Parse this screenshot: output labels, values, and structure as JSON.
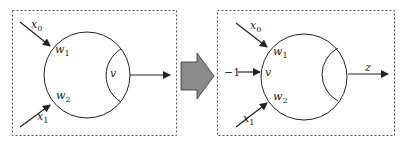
{
  "diagram": {
    "left_panel": {
      "inputs": [
        {
          "label": "x",
          "subscript": "0",
          "weight": "w",
          "weight_subscript": "1"
        },
        {
          "label": "x",
          "subscript": "1",
          "weight": "w",
          "weight_subscript": "2"
        }
      ],
      "threshold_label": "v",
      "output_label": ""
    },
    "transform_arrow": "right-arrow",
    "right_panel": {
      "inputs": [
        {
          "label": "x",
          "subscript": "0",
          "weight": "w",
          "weight_subscript": "1"
        },
        {
          "label": "−1",
          "subscript": "",
          "weight": "v",
          "weight_subscript": ""
        },
        {
          "label": "x",
          "subscript": "1",
          "weight": "w",
          "weight_subscript": "2"
        }
      ],
      "output_label": "z"
    },
    "colors": {
      "stroke": "#222222",
      "dashed_border": "#555555",
      "arrow_fill": "#8a8a8a",
      "arrow_stroke": "#333333"
    }
  }
}
